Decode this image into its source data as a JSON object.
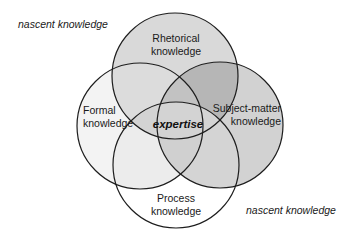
{
  "diagram": {
    "type": "venn",
    "center_label": "expertise",
    "circles": [
      {
        "id": "rhetorical",
        "line1": "Rhetorical",
        "line2": "knowledge",
        "fill": "#d8d8d8"
      },
      {
        "id": "formal",
        "line1": "Formal",
        "line2": "knowledge",
        "fill": "#f3f3f3"
      },
      {
        "id": "subject-matter",
        "line1": "Subject-matter",
        "line2": "knowledge",
        "fill": "#cfcfcf"
      },
      {
        "id": "process",
        "line1": "Process",
        "line2": "knowledge",
        "fill": "#ffffff"
      }
    ],
    "outside_labels": [
      {
        "text": "nascent knowledge",
        "position": "top-left"
      },
      {
        "text": "nascent knowledge",
        "position": "bottom-right"
      }
    ],
    "colors": {
      "stroke": "#1e1e1e",
      "background": "#ffffff"
    }
  }
}
